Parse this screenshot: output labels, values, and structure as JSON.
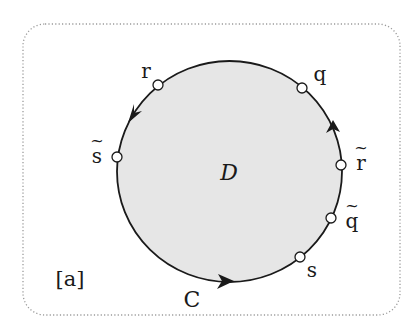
{
  "figure": {
    "panel_label": "[a]",
    "region_label": "D",
    "curve_label": "C",
    "points": [
      {
        "id": "r",
        "label": "r",
        "tilde": false
      },
      {
        "id": "q",
        "label": "q",
        "tilde": false
      },
      {
        "id": "s_tilde",
        "label": "s",
        "tilde": true
      },
      {
        "id": "r_tilde",
        "label": "r",
        "tilde": true
      },
      {
        "id": "q_tilde",
        "label": "q",
        "tilde": true
      },
      {
        "id": "s",
        "label": "s",
        "tilde": false
      }
    ],
    "tilde_glyph": "~",
    "colors": {
      "region_fill": "#e6e6e6",
      "stroke": "#1a1a1a",
      "frame": "#9a9a9a"
    }
  }
}
